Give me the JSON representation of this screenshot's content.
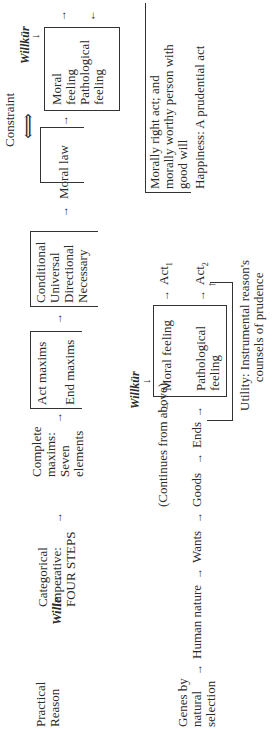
{
  "top_row": {
    "practical_reason": [
      "Practical",
      "Reason"
    ],
    "wille": "Wille",
    "categorical_imperative": [
      "Categorical",
      "Imperative:",
      "FOUR STEPS"
    ],
    "complete_maxims": [
      "Complete",
      "maxims:",
      "Seven",
      "elements"
    ],
    "maxims_bracket": [
      "Act maxims",
      "End maxims"
    ],
    "properties_box": [
      "Conditional",
      "Universal",
      "Directional",
      "Necessary"
    ],
    "moral_law": "Moral law",
    "constraint": "Constraint",
    "willkur": "Willkür",
    "feelings_box": [
      "Moral",
      "feeling",
      "Pathological",
      "feeling"
    ]
  },
  "bottom_row": {
    "genes": [
      "Genes by",
      "natural",
      "selection"
    ],
    "human_nature": "Human nature",
    "wants": "Wants",
    "goods": "Goods",
    "ends": "Ends",
    "continues": "(Continues from above)",
    "willkur": "Willkür",
    "moral_feeling": "Moral feeling",
    "pathological_feeling": [
      "Pathological",
      "feeling"
    ],
    "act1": "Act",
    "act1_sub": "1",
    "act2": "Act",
    "act2_sub": "2",
    "morally_right": [
      "Morally right act; and",
      "morally worthy person with",
      "good will"
    ],
    "happiness": "Happiness: A prudential act",
    "utility": [
      "Utility: Instrumental reason's",
      "counsels of prudence"
    ]
  },
  "arrows": {
    "right": "→",
    "up": "↑",
    "down": "↓",
    "double": "⟺"
  }
}
